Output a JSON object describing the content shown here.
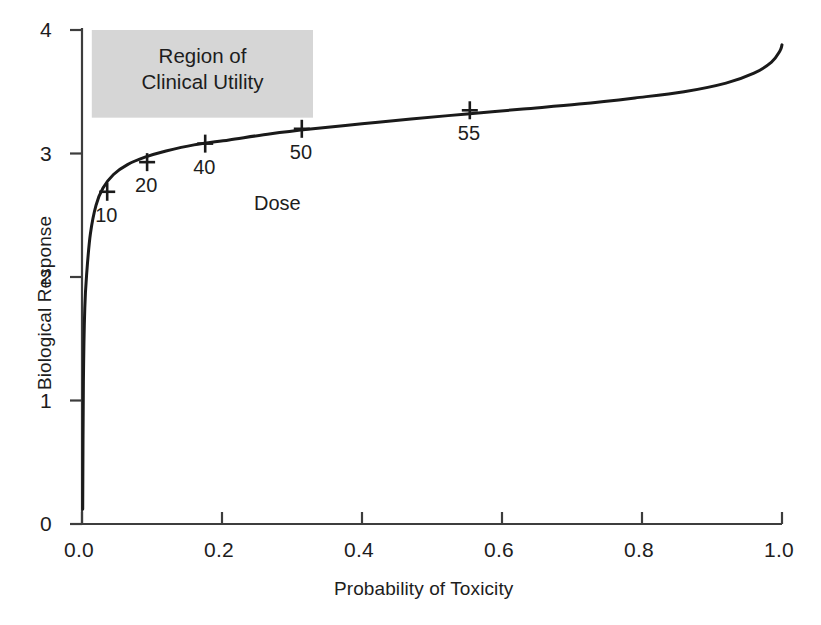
{
  "chart_data": {
    "type": "line",
    "title": "",
    "subtitle": "",
    "xlabel": "Probability of Toxicity",
    "ylabel": "Biological Response",
    "xlim": [
      0.0,
      1.0
    ],
    "ylim": [
      0,
      4
    ],
    "xticks": [
      "0.0",
      "0.2",
      "0.4",
      "0.6",
      "0.8",
      "1.0"
    ],
    "xtick_values": [
      0.0,
      0.2,
      0.4,
      0.6,
      0.8,
      1.0
    ],
    "yticks": [
      "0",
      "1",
      "2",
      "3",
      "4"
    ],
    "ytick_values": [
      0,
      1,
      2,
      3,
      4
    ],
    "grid": false,
    "legend": null,
    "series": [
      {
        "name": "dose-response curve",
        "x": [
          0.001,
          0.002,
          0.004,
          0.007,
          0.012,
          0.02,
          0.03,
          0.045,
          0.065,
          0.09,
          0.12,
          0.16,
          0.21,
          0.27,
          0.33,
          0.4,
          0.47,
          0.55,
          0.63,
          0.71,
          0.79,
          0.86,
          0.92,
          0.96,
          0.985,
          0.997,
          1.0
        ],
        "y": [
          0.12,
          1.15,
          1.75,
          2.05,
          2.35,
          2.58,
          2.72,
          2.83,
          2.91,
          2.97,
          3.02,
          3.07,
          3.11,
          3.16,
          3.2,
          3.24,
          3.28,
          3.32,
          3.36,
          3.4,
          3.45,
          3.5,
          3.57,
          3.65,
          3.74,
          3.83,
          3.88
        ]
      }
    ],
    "annotations": {
      "dose_markers_label": "Dose",
      "dose_markers": [
        {
          "label": "10",
          "x": 0.036,
          "y": 2.69
        },
        {
          "label": "20",
          "x": 0.093,
          "y": 2.93
        },
        {
          "label": "40",
          "x": 0.176,
          "y": 3.08
        },
        {
          "label": "50",
          "x": 0.314,
          "y": 3.2
        },
        {
          "label": "55",
          "x": 0.554,
          "y": 3.35
        }
      ],
      "shaded_region": {
        "line1": "Region of",
        "line2": "Clinical Utility",
        "x_range": [
          0.014,
          0.33
        ],
        "y_range": [
          3.29,
          4.0
        ],
        "color": "#d6d6d6"
      }
    }
  },
  "colors": {
    "curve": "#1a1a1a",
    "axis": "#3d3d3d",
    "text": "#1d1d1d",
    "shaded_region": "#d6d6d6",
    "background": "#ffffff"
  }
}
